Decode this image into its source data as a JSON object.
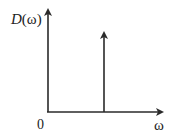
{
  "diagram": {
    "type": "spectrum-plot",
    "y_axis_label": {
      "func": "D",
      "open": "(",
      "var": "ω",
      "close": ")"
    },
    "x_axis_label": "ω",
    "origin_label": "0",
    "colors": {
      "line": "#2a2a2a",
      "background": "#ffffff"
    },
    "elements": [
      {
        "kind": "axis",
        "direction": "vertical",
        "arrow": true
      },
      {
        "kind": "axis",
        "direction": "horizontal",
        "arrow": true
      },
      {
        "kind": "impulse",
        "position": "mid-axis",
        "arrow": true
      }
    ]
  }
}
